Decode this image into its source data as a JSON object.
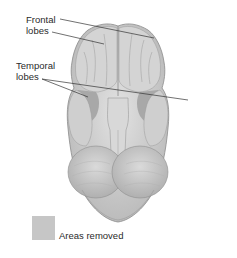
{
  "diagram": {
    "labels": {
      "frontal": [
        "Frontal",
        "lobes"
      ],
      "temporal": [
        "Temporal",
        "lobes"
      ]
    },
    "legend": {
      "swatch_color": "#c6c6c6",
      "text": "Areas removed"
    },
    "colors": {
      "brain_light": "#dcdcdc",
      "brain_mid": "#bdbdbd",
      "brain_dark": "#9a9a9a",
      "removed_area": "#a8a8a8",
      "outline": "#8a8a8a",
      "leader_line": "#333333"
    }
  }
}
